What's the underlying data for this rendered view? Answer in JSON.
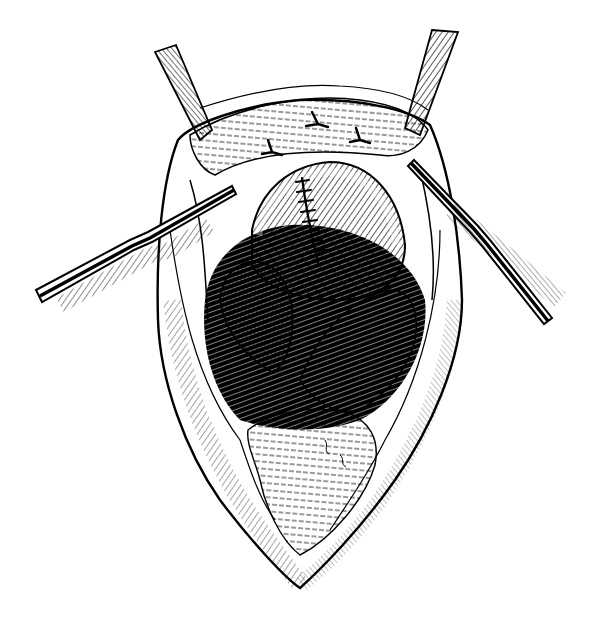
{
  "image": {
    "kind": "pen-and-ink medical illustration",
    "subject": "open surgical incision held apart by two retractors, showing sutured organ and underlying tissue",
    "colors": {
      "background": "#ffffff",
      "ink": "#000000"
    },
    "elements": [
      "left-retractor",
      "right-retractor",
      "left-upper-retractor-blade",
      "right-upper-retractor-blade",
      "incision-outline",
      "upper-tissue-flap-with-sutures",
      "sutured-organ",
      "left-lobe",
      "right-lobe",
      "dark-cavity",
      "lower-tissue-mass"
    ],
    "visible_text": []
  }
}
